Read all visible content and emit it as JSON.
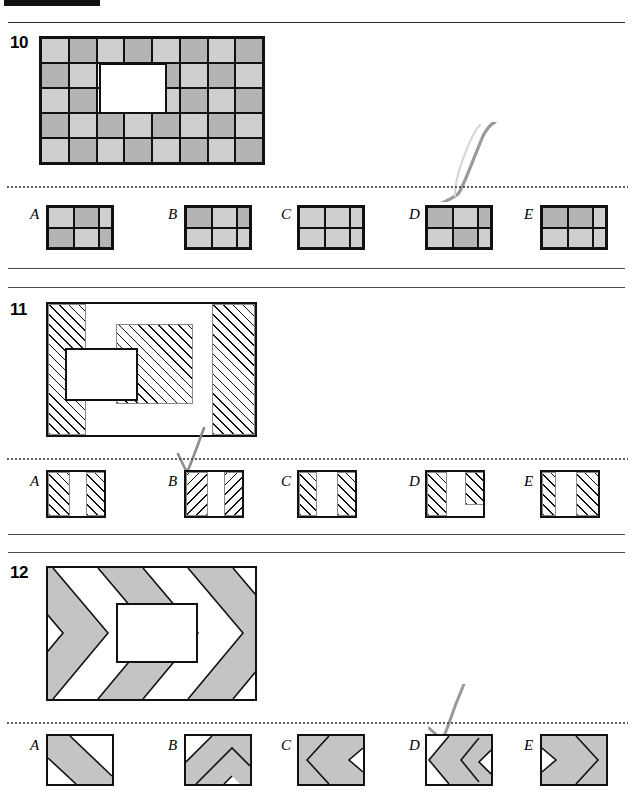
{
  "page": {
    "width": 633,
    "height": 797,
    "background": "#ffffff",
    "ink_color": "#111111",
    "pencil_color": "#8d8d8d"
  },
  "palette": {
    "light_gray": "#cfcfcf",
    "mid_gray": "#b4b4b4",
    "chevron_gray": "#c4c4c4",
    "white": "#ffffff",
    "rule": "#2b2b2b",
    "dot": "#5b5b5b"
  },
  "questions": [
    {
      "number": "10",
      "type": "grid-shading",
      "stimulus": {
        "description": "8 by 5 grid of shaded squares with a white rectangular hole",
        "columns": 8,
        "rows": 5,
        "cells": [
          [
            "light",
            "dark",
            "light",
            "dark",
            "light",
            "dark",
            "light",
            "dark"
          ],
          [
            "dark",
            "light",
            "hole",
            "hole",
            "dark",
            "light",
            "dark",
            "light"
          ],
          [
            "light",
            "dark",
            "hole",
            "hole",
            "light",
            "dark",
            "light",
            "dark"
          ],
          [
            "dark",
            "light",
            "dark",
            "light",
            "dark",
            "light",
            "dark",
            "light"
          ],
          [
            "light",
            "dark",
            "light",
            "dark",
            "light",
            "dark",
            "light",
            "dark"
          ]
        ],
        "hole": {
          "start_col": 2,
          "start_row": 1,
          "span_cols": 2,
          "span_rows": 2
        }
      },
      "options": [
        {
          "letter": "A",
          "cells": [
            [
              "light",
              "dark",
              "light"
            ],
            [
              "dark",
              "light",
              "dark"
            ]
          ]
        },
        {
          "letter": "B",
          "cells": [
            [
              "dark",
              "light",
              "dark"
            ],
            [
              "light",
              "light",
              "light"
            ]
          ]
        },
        {
          "letter": "C",
          "cells": [
            [
              "light",
              "light",
              "light"
            ],
            [
              "light",
              "light",
              "light"
            ]
          ]
        },
        {
          "letter": "D",
          "cells": [
            [
              "dark",
              "light",
              "dark"
            ],
            [
              "light",
              "dark",
              "light"
            ]
          ]
        },
        {
          "letter": "E",
          "cells": [
            [
              "dark",
              "dark",
              "light"
            ],
            [
              "light",
              "light",
              "light"
            ]
          ]
        }
      ],
      "marked_answer": "D"
    },
    {
      "number": "11",
      "type": "hatched-overlap",
      "stimulus": {
        "description": "Outer rectangle with diagonal hatched left and right bands, an inner hatched square, and a white rectangle overlapping at left",
        "bands": [
          {
            "name": "left-band",
            "fill": "hatch-right"
          },
          {
            "name": "middle-gap",
            "fill": "plain"
          },
          {
            "name": "right-band",
            "fill": "hatch-right"
          }
        ],
        "inner_square_fill": "hatch-right",
        "white_block": "white rectangle with black border"
      },
      "options": [
        {
          "letter": "A",
          "segments": [
            {
              "fill": "hatch-right",
              "note": "left band"
            },
            {
              "fill": "plain",
              "note": "middle white"
            },
            {
              "fill": "hatch-right",
              "note": "right band"
            }
          ]
        },
        {
          "letter": "B",
          "segments": [
            {
              "fill": "hatch-left",
              "note": "left band"
            },
            {
              "fill": "plain",
              "note": "middle white"
            },
            {
              "fill": "hatch-left",
              "note": "right band"
            }
          ]
        },
        {
          "letter": "C",
          "segments": [
            {
              "fill": "hatch-right",
              "note": "left band narrow"
            },
            {
              "fill": "plain",
              "note": "middle white"
            },
            {
              "fill": "hatch-right",
              "note": "right band"
            }
          ]
        },
        {
          "letter": "D",
          "segments": [
            {
              "fill": "hatch-right",
              "note": "left band"
            },
            {
              "fill": "plain",
              "note": "middle white"
            },
            {
              "fill": "hatch-right",
              "note": "right band, shortened - notch at bottom"
            }
          ]
        },
        {
          "letter": "E",
          "segments": [
            {
              "fill": "hatch-right",
              "note": "left band narrow"
            },
            {
              "fill": "plain",
              "note": "middle white"
            },
            {
              "fill": "hatch-right",
              "note": "right band wide"
            }
          ]
        }
      ],
      "marked_answer": "B"
    },
    {
      "number": "12",
      "type": "chevron-bands",
      "stimulus": {
        "description": "Rectangle filled with left-pointing chevron bands alternating gray and white, with a white rectangle in the centre",
        "bands": [
          "gray",
          "white",
          "gray",
          "white",
          "gray"
        ],
        "chevron_direction": "left",
        "centre_block": "white rectangle with black border"
      },
      "options": [
        {
          "letter": "A",
          "pattern": "diagonal band gray, white wedge upper-right, gray lower-left"
        },
        {
          "letter": "B",
          "pattern": "diagonal band gray, white wedge upper-left, gray chevron lower"
        },
        {
          "letter": "C",
          "pattern": "left-pointing chevrons, gray with one white notch at right"
        },
        {
          "letter": "D",
          "pattern": "left-pointing chevrons, white notch at left edge, two gray chevrons"
        },
        {
          "letter": "E",
          "pattern": "right-pointing chevrons, gray with white notch at left"
        }
      ],
      "marked_answer": "D"
    }
  ]
}
